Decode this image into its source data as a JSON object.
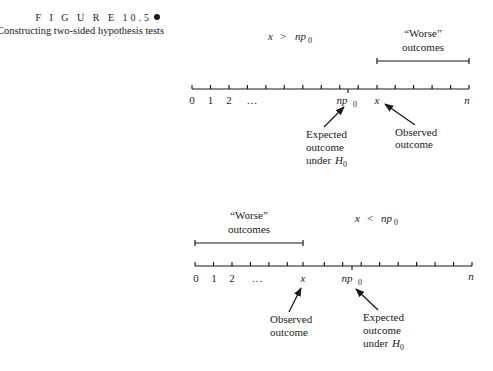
{
  "figure": {
    "label": "F I G U R E  10.5",
    "caption": "Constructing two-sided hypothesis tests"
  },
  "panels": [
    {
      "id": "upper",
      "condition": {
        "lhs": "x",
        "op": ">",
        "rhs_base": "np",
        "rhs_sub": "0"
      },
      "worse_label": [
        "“Worse”",
        "outcomes"
      ],
      "worse_region": "from x to n",
      "axis_labels": [
        "0",
        "1",
        "2",
        "…",
        "np0",
        "x",
        "n"
      ],
      "annotations": {
        "expected": [
          "Expected",
          "outcome",
          "under H0"
        ],
        "observed": [
          "Observed",
          "outcome"
        ]
      }
    },
    {
      "id": "lower",
      "condition": {
        "lhs": "x",
        "op": "<",
        "rhs_base": "np",
        "rhs_sub": "0"
      },
      "worse_label": [
        "“Worse”",
        "outcomes"
      ],
      "worse_region": "from 0 to x",
      "axis_labels": [
        "0",
        "1",
        "2",
        "…",
        "x",
        "np0",
        "n"
      ],
      "annotations": {
        "observed": [
          "Observed",
          "outcome"
        ],
        "expected": [
          "Expected",
          "outcome",
          "under H0"
        ]
      }
    }
  ],
  "text": {
    "x": "x",
    "gt": ">",
    "lt": "<",
    "np": "np",
    "sub0": "0",
    "n": "n",
    "zero": "0",
    "one": "1",
    "two": "2",
    "ellipsis": "…",
    "worse": "“Worse”",
    "outcomes": "outcomes",
    "expected": "Expected",
    "outcome": "outcome",
    "under": "under",
    "H": "H",
    "observed": "Observed"
  }
}
